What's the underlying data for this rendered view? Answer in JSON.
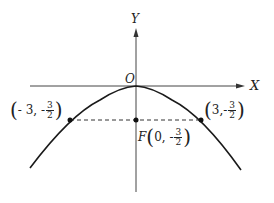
{
  "diagram": {
    "axes": {
      "x_label": "X",
      "y_label": "Y",
      "origin_label": "O"
    },
    "curve": "downward parabola with vertex at origin (x^2 = -6y)",
    "points": [
      {
        "name": "left-point",
        "x": "- 3",
        "y_sign": "-",
        "y_num": "3",
        "y_den": "2"
      },
      {
        "name": "focus",
        "prefix": "F",
        "x": "0",
        "y_sign": "-",
        "y_num": "3",
        "y_den": "2"
      },
      {
        "name": "right-point",
        "x": "3",
        "y_sign": "-",
        "y_num": "3",
        "y_den": "2"
      }
    ],
    "colors": {
      "stroke": "#1a1a1a",
      "text": "#222222"
    }
  }
}
